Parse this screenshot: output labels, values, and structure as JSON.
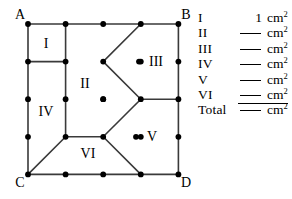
{
  "figure": {
    "corner_labels": [
      {
        "name": "A",
        "text": "A"
      },
      {
        "name": "B",
        "text": "B"
      },
      {
        "name": "C",
        "text": "C"
      },
      {
        "name": "D",
        "text": "D"
      }
    ],
    "region_labels": [
      {
        "name": "I",
        "text": "I"
      },
      {
        "name": "II",
        "text": "II"
      },
      {
        "name": "III",
        "text": "III"
      },
      {
        "name": "IV",
        "text": "IV"
      },
      {
        "name": "V",
        "text": "V"
      },
      {
        "name": "VI",
        "text": "VI"
      }
    ],
    "grid": {
      "columns": 4,
      "rows": 4,
      "dot_color": "#000000",
      "line_color": "#3a3a3a"
    }
  },
  "answers": {
    "unit": "cm",
    "unit_exponent": "2",
    "blank": "",
    "rows": [
      {
        "label": "I",
        "value": "1",
        "is_blank": false
      },
      {
        "label": "II",
        "value": "",
        "is_blank": true
      },
      {
        "label": "III",
        "value": "",
        "is_blank": true
      },
      {
        "label": "IV",
        "value": "",
        "is_blank": true
      },
      {
        "label": "V",
        "value": "",
        "is_blank": true
      },
      {
        "label": "VI",
        "value": "",
        "is_blank": true
      },
      {
        "label": "Total",
        "value": "",
        "is_blank": true
      }
    ]
  }
}
